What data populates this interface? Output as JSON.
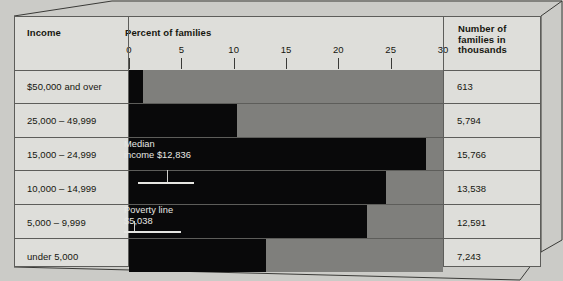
{
  "header": {
    "income_label": "Income",
    "percent_label": "Percent of families",
    "count_label_line1": "Number of",
    "count_label_line2": "families in",
    "count_label_line3": "thousands"
  },
  "annotations": {
    "median_line1": "Median",
    "median_line2": "income $12,836",
    "poverty_line1": "Poverty line",
    "poverty_line2": "$5,038"
  },
  "chart_data": {
    "type": "bar",
    "title": "Percent of families",
    "xlabel": "Percent of families",
    "ylabel": "Income",
    "orientation": "horizontal",
    "xlim": [
      0,
      30
    ],
    "grid": false,
    "legend": false,
    "tick_labels": [
      "0",
      "5",
      "10",
      "15",
      "20",
      "25",
      "30"
    ],
    "tick_values": [
      0,
      5,
      10,
      15,
      20,
      25,
      30
    ],
    "categories": [
      "$50,000 and over",
      "25,000 – 49,999",
      "15,000 – 24,999",
      "10,000 – 14,999",
      "5,000 – 9,999",
      "under 5,000"
    ],
    "values": [
      1.3,
      10.3,
      28.4,
      24.6,
      22.7,
      13.1
    ],
    "counts": [
      "613",
      "5,794",
      "15,766",
      "13,538",
      "12,591",
      "7,243"
    ],
    "annotations": [
      {
        "label": "Median income",
        "value": "$12,836",
        "row": 3
      },
      {
        "label": "Poverty line",
        "value": "$5,038",
        "row": 5
      }
    ],
    "colors": {
      "bar": "#09090a",
      "track": "#7f7f7c",
      "panel": "#dededa",
      "rule": "#5d5d5a",
      "text": "#16160f",
      "anno_text": "#e8e8e4"
    }
  },
  "rows": [
    {
      "label": "$50,000 and over",
      "value": 1.3,
      "count": "613"
    },
    {
      "label": "25,000 – 49,999",
      "value": 10.3,
      "count": "5,794"
    },
    {
      "label": "15,000 – 24,999",
      "value": 28.4,
      "count": "15,766"
    },
    {
      "label": "10,000 – 14,999",
      "value": 24.6,
      "count": "13,538"
    },
    {
      "label": "5,000 – 9,999",
      "value": 22.7,
      "count": "12,591"
    },
    {
      "label": "under 5,000",
      "value": 13.1,
      "count": "7,243"
    }
  ]
}
